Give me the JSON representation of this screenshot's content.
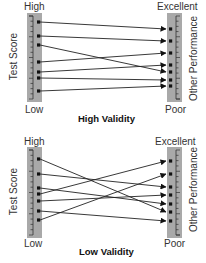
{
  "panels": [
    {
      "title": "High Validity",
      "left_axis": {
        "label": "Test Score",
        "top": "High",
        "bottom": "Low"
      },
      "right_axis": {
        "label": "Other Performance",
        "top": "Excellent",
        "bottom": "Poor"
      },
      "bar_top": 13,
      "bar_bottom": 102,
      "left_points": [
        22,
        36,
        45,
        62,
        72,
        78,
        91
      ],
      "right_points": [
        29,
        41,
        53,
        65,
        72,
        80,
        86
      ],
      "links": [
        [
          0,
          0
        ],
        [
          1,
          1
        ],
        [
          2,
          4
        ],
        [
          3,
          2
        ],
        [
          4,
          3
        ],
        [
          5,
          5
        ],
        [
          6,
          6
        ]
      ]
    },
    {
      "title": "Low Validity",
      "left_axis": {
        "label": "Test Score",
        "top": "High",
        "bottom": "Low"
      },
      "right_axis": {
        "label": "Other Performance",
        "top": "Excellent",
        "bottom": "Poor"
      },
      "bar_top": 147,
      "bar_bottom": 238,
      "left_points": [
        159,
        174,
        188,
        194,
        201,
        211,
        220
      ],
      "right_points": [
        161,
        174,
        187,
        195,
        204,
        212,
        221
      ],
      "links": [
        [
          0,
          5
        ],
        [
          1,
          2
        ],
        [
          2,
          4
        ],
        [
          3,
          0
        ],
        [
          4,
          3
        ],
        [
          5,
          6
        ],
        [
          6,
          1
        ]
      ]
    }
  ],
  "colors": {
    "bar": "#a9a9a9",
    "line": "#222222",
    "tick": "#333333"
  }
}
